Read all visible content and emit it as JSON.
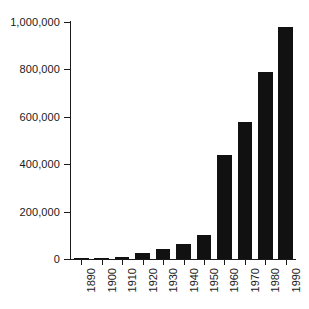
{
  "chart_data": {
    "type": "bar",
    "title": "",
    "subtitle": "",
    "xlabel": "",
    "ylabel": "",
    "categories": [
      "1890",
      "1900",
      "1910",
      "1920",
      "1930",
      "1940",
      "1950",
      "1960",
      "1970",
      "1980",
      "1990"
    ],
    "values": [
      2000,
      5000,
      10000,
      26000,
      42000,
      62000,
      103000,
      437000,
      580000,
      789000,
      977000
    ],
    "series": [
      {
        "name": "value",
        "values": [
          2000,
          5000,
          10000,
          26000,
          42000,
          62000,
          103000,
          437000,
          580000,
          789000,
          977000
        ]
      }
    ],
    "ylim": [
      0,
      1000000
    ],
    "ytick_values": [
      0,
      200000,
      400000,
      600000,
      800000,
      1000000
    ],
    "ytick_labels": [
      "0",
      "200,000",
      "400,000",
      "600,000",
      "800,000",
      "1,000,000"
    ],
    "xtick_labels": [
      "1890",
      "1900",
      "1910",
      "1920",
      "1930",
      "1940",
      "1950",
      "1960",
      "1970",
      "1980",
      "1990"
    ],
    "grid": false,
    "legend": false,
    "legend_position": "none",
    "bar_color": "#111111",
    "axis_color": "#1a1a1a",
    "background_color": "#ffffff",
    "xtick_label_rotation": 90,
    "annotations": []
  }
}
